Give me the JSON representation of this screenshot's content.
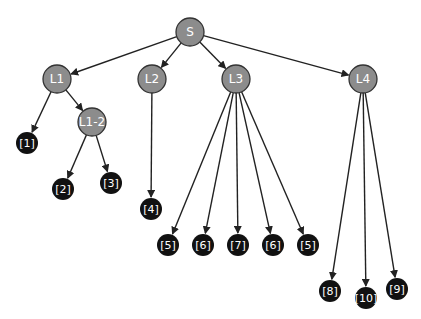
{
  "diagram": {
    "type": "tree",
    "colors": {
      "inner_fill": "#8c8c8c",
      "inner_stroke": "#333333",
      "leaf_fill": "#111111",
      "edge": "#222222",
      "text": "#ffffff"
    },
    "nodes": [
      {
        "id": "S",
        "label": "S",
        "kind": "inner",
        "x": 190,
        "y": 32,
        "r": 14
      },
      {
        "id": "L1",
        "label": "L1",
        "kind": "inner",
        "x": 57,
        "y": 79,
        "r": 14
      },
      {
        "id": "L2",
        "label": "L2",
        "kind": "inner",
        "x": 152,
        "y": 79,
        "r": 14
      },
      {
        "id": "L3",
        "label": "L3",
        "kind": "inner",
        "x": 236,
        "y": 79,
        "r": 14
      },
      {
        "id": "L4",
        "label": "L4",
        "kind": "inner",
        "x": 363,
        "y": 79,
        "r": 14
      },
      {
        "id": "L1-2",
        "label": "L1-2",
        "kind": "inner",
        "x": 92,
        "y": 122,
        "r": 14
      },
      {
        "id": "n1",
        "label": "[1]",
        "kind": "leaf",
        "x": 27,
        "y": 143,
        "r": 11
      },
      {
        "id": "n2",
        "label": "[2]",
        "kind": "leaf",
        "x": 63,
        "y": 189,
        "r": 11
      },
      {
        "id": "n3",
        "label": "[3]",
        "kind": "leaf",
        "x": 111,
        "y": 183,
        "r": 11
      },
      {
        "id": "n4",
        "label": "[4]",
        "kind": "leaf",
        "x": 151,
        "y": 209,
        "r": 11
      },
      {
        "id": "n5a",
        "label": "[5]",
        "kind": "leaf",
        "x": 168,
        "y": 245,
        "r": 11
      },
      {
        "id": "n6a",
        "label": "[6]",
        "kind": "leaf",
        "x": 203,
        "y": 245,
        "r": 11
      },
      {
        "id": "n7",
        "label": "[7]",
        "kind": "leaf",
        "x": 238,
        "y": 245,
        "r": 11
      },
      {
        "id": "n6b",
        "label": "[6]",
        "kind": "leaf",
        "x": 273,
        "y": 245,
        "r": 11
      },
      {
        "id": "n5b",
        "label": "[5]",
        "kind": "leaf",
        "x": 308,
        "y": 245,
        "r": 11
      },
      {
        "id": "n8",
        "label": "[8]",
        "kind": "leaf",
        "x": 330,
        "y": 291,
        "r": 11
      },
      {
        "id": "n10",
        "label": "[10]",
        "kind": "leaf",
        "x": 366,
        "y": 298,
        "r": 11
      },
      {
        "id": "n9",
        "label": "[9]",
        "kind": "leaf",
        "x": 397,
        "y": 289,
        "r": 11
      }
    ],
    "edges": [
      [
        "S",
        "L1"
      ],
      [
        "S",
        "L2"
      ],
      [
        "S",
        "L3"
      ],
      [
        "S",
        "L4"
      ],
      [
        "L1",
        "n1"
      ],
      [
        "L1",
        "L1-2"
      ],
      [
        "L1-2",
        "n2"
      ],
      [
        "L1-2",
        "n3"
      ],
      [
        "L2",
        "n4"
      ],
      [
        "L3",
        "n5a"
      ],
      [
        "L3",
        "n6a"
      ],
      [
        "L3",
        "n7"
      ],
      [
        "L3",
        "n6b"
      ],
      [
        "L3",
        "n5b"
      ],
      [
        "L4",
        "n8"
      ],
      [
        "L4",
        "n10"
      ],
      [
        "L4",
        "n9"
      ]
    ]
  }
}
